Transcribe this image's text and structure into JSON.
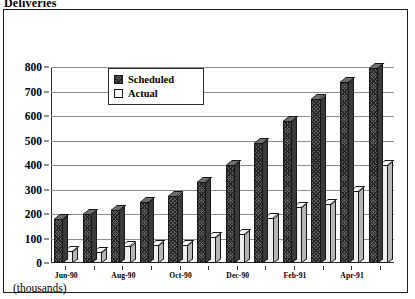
{
  "title": "Deliveries",
  "units_label": "(thousands)",
  "legend": {
    "position": "inside-top-left",
    "entries": [
      {
        "label": "Scheduled",
        "swatch": "dark-crosshatch-swatch"
      },
      {
        "label": "Actual",
        "swatch": "light-empty-swatch"
      }
    ]
  },
  "axis": {
    "y_ticks": [
      "800",
      "700",
      "600",
      "500",
      "400",
      "300",
      "200",
      "100",
      "0"
    ],
    "x_visible_labels": [
      "Jun-90",
      "Aug-90",
      "Oct-90",
      "Dec-90",
      "Feb-91",
      "Apr-91"
    ]
  },
  "chart_data": {
    "type": "bar",
    "title": "Deliveries",
    "subtitle": "",
    "xlabel": "",
    "ylabel": "(thousands)",
    "ylim": [
      0,
      800
    ],
    "ytick_step": 100,
    "grid": true,
    "legend_position": "inside-top-left",
    "categories": [
      "Jun-90",
      "Jul-90",
      "Aug-90",
      "Sep-90",
      "Oct-90",
      "Nov-90",
      "Dec-90",
      "Jan-91",
      "Feb-91",
      "Mar-91",
      "Apr-91",
      "May-91"
    ],
    "visible_tick_labels": [
      "Jun-90",
      "",
      "Aug-90",
      "",
      "Oct-90",
      "",
      "Dec-90",
      "",
      "Feb-91",
      "",
      "Apr-91",
      ""
    ],
    "series": [
      {
        "name": "Scheduled",
        "color": "#5f5f5f",
        "values": [
          180,
          200,
          215,
          250,
          275,
          330,
          400,
          490,
          580,
          670,
          740,
          795
        ]
      },
      {
        "name": "Actual",
        "color": "#eeeeee",
        "values": [
          50,
          45,
          70,
          75,
          75,
          105,
          120,
          185,
          230,
          240,
          295,
          400
        ]
      }
    ]
  }
}
